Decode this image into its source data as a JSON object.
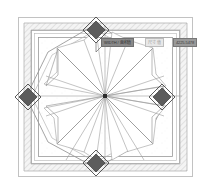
{
  "drawing": {
    "title": "Octagonal Pavilion Plan",
    "type": "architectural-floor-plan",
    "background": "#ffffff"
  },
  "colors": {
    "outer_frame": "#b9b9b9",
    "hatch_line": "#a9a9a9",
    "hatch_fill": "#f2f2f2",
    "plan_line": "#8d8d8d",
    "inner_line": "#a0a0a0",
    "column_dark": "#595959",
    "column_outline": "#3d3d3d",
    "center_marker": "#2b2b2b",
    "callout_dark": "#8a8a8a",
    "callout_light": "#e8e8e8",
    "callout_right": "#9a9a9a"
  },
  "callout": {
    "label": "WIDTH / 面积值",
    "field": "尺寸 值",
    "value": "4225.5478"
  },
  "geometry": {
    "center": {
      "x": 105,
      "y": 96
    },
    "outer_frame": {
      "x": 18,
      "y": 17,
      "width": 175,
      "height": 160
    },
    "hatch_band": {
      "x": 24,
      "y": 23,
      "width": 163,
      "height": 148
    },
    "columns": [
      {
        "name": "column-north",
        "cx": 96,
        "cy": 30
      },
      {
        "name": "column-west",
        "cx": 28,
        "cy": 97
      },
      {
        "name": "column-east",
        "cx": 160,
        "cy": 97
      },
      {
        "name": "column-south",
        "cx": 96,
        "cy": 162
      }
    ],
    "octagon_radius": 68,
    "petal_count": 8,
    "radial_spokes": 16
  }
}
